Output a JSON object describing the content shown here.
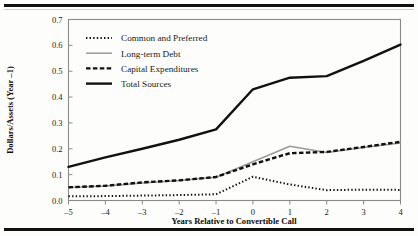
{
  "figure": {
    "background_color": "#fdfdfb",
    "rule_color": "#111111",
    "frame_color": "#8a8a8a"
  },
  "chart_data": {
    "type": "line",
    "title": "",
    "xlabel": "Years Relative to Convertible Call",
    "ylabel": "Dollars/Assets (Year –1)",
    "xlim": [
      -5,
      4
    ],
    "ylim": [
      0.0,
      0.7
    ],
    "grid": false,
    "legend_position": "upper-left-inside",
    "x": [
      -5,
      -4,
      -3,
      -2,
      -1,
      0,
      1,
      2,
      3,
      4
    ],
    "xticklabels": [
      "–5",
      "–4",
      "–3",
      "–2",
      "–1",
      "0",
      "1",
      "2",
      "3",
      "4"
    ],
    "yticks": [
      0.0,
      0.1,
      0.2,
      0.3,
      0.4,
      0.5,
      0.6,
      0.7
    ],
    "yticklabels": [
      "0.0",
      "0.1",
      "0.2",
      "0.3",
      "0.4",
      "0.5",
      "0.6",
      "0.7"
    ],
    "series": [
      {
        "name": "Common and Preferred",
        "style": "dotted",
        "color": "#111111",
        "width": 2.0,
        "dash": "1.4,2.2",
        "values": [
          0.016,
          0.017,
          0.019,
          0.021,
          0.024,
          0.092,
          0.062,
          0.04,
          0.042,
          0.041
        ]
      },
      {
        "name": "Long-term Debt",
        "style": "solid",
        "color": "#9a9a9a",
        "width": 1.5,
        "dash": "none",
        "values": [
          0.05,
          0.056,
          0.068,
          0.077,
          0.09,
          0.15,
          0.21,
          0.186,
          0.205,
          0.222
        ]
      },
      {
        "name": "Capital Expenditures",
        "style": "dashed",
        "color": "#111111",
        "width": 2.4,
        "dash": "4.5,2.4",
        "values": [
          0.051,
          0.057,
          0.07,
          0.078,
          0.091,
          0.14,
          0.183,
          0.188,
          0.207,
          0.227
        ]
      },
      {
        "name": "Total Sources",
        "style": "solid",
        "color": "#111111",
        "width": 2.4,
        "dash": "none",
        "values": [
          0.13,
          0.167,
          0.2,
          0.235,
          0.275,
          0.43,
          0.475,
          0.481,
          0.54,
          0.603
        ]
      }
    ]
  },
  "legend": {
    "entries": [
      {
        "label": "Common and Preferred"
      },
      {
        "label": "Long-term Debt"
      },
      {
        "label": "Capital Expenditures"
      },
      {
        "label": "Total Sources"
      }
    ]
  }
}
